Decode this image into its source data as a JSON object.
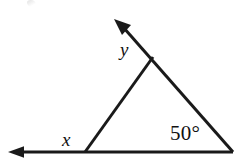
{
  "figure": {
    "kind": "geometry-diagram",
    "background_color": "#ffffff",
    "stroke_color": "#1a1a1a",
    "stroke_width": 3,
    "canvas": {
      "width": 250,
      "height": 168
    },
    "labels": {
      "apex_angle": "y",
      "left_exterior_angle": "x",
      "right_angle_measure": "50°"
    },
    "points": {
      "left_vertex": {
        "x": 85,
        "y": 152
      },
      "right_vertex": {
        "x": 233,
        "y": 152
      },
      "apex": {
        "x": 153,
        "y": 57
      },
      "base_arrow_tip": {
        "x": 8,
        "y": 152
      },
      "ray_arrow_tip": {
        "x": 114,
        "y": 19
      }
    },
    "segments": [
      {
        "name": "base-line",
        "from": "base_arrow_tip",
        "to": "right_vertex",
        "arrow_at": "from"
      },
      {
        "name": "left-side",
        "from": "left_vertex",
        "to": "apex",
        "arrow_at": "none"
      },
      {
        "name": "right-side-extended",
        "from": "right_vertex",
        "to": "ray_arrow_tip",
        "arrow_at": "to"
      }
    ]
  }
}
